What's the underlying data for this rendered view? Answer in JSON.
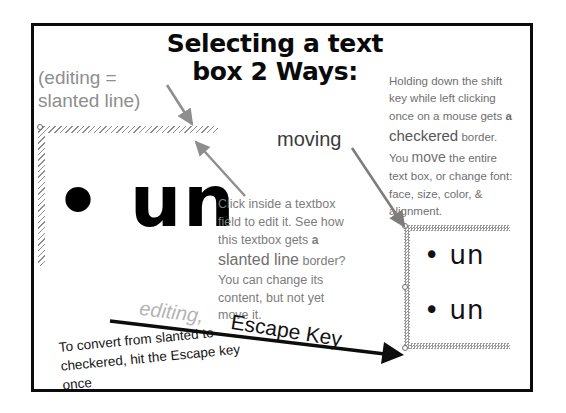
{
  "slide": {
    "title": {
      "line1": "Selecting a text",
      "line2": "box 2 Ways:"
    },
    "labels": {
      "editing_equals": {
        "line1": "(editing =",
        "line2": "slanted line)"
      },
      "moving": "moving",
      "editing_comma": "editing,",
      "escape_key": "Escape Key"
    },
    "center_paragraph": {
      "part1": "Click inside a textbox field to edit it. See how this textbox gets",
      "emphasis_small": "a",
      "emphasis_big": "slanted line",
      "part2": "border? You can change its content, but not yet move it."
    },
    "right_paragraph": {
      "part1": "Holding down the shift key while left clicking once on a mouse gets",
      "emphasis_small": "a",
      "emphasis_big": "checkered",
      "part2_a": "border. You",
      "part2_emph": "move",
      "part2_b": "the entire text box, or change font: face, size, color, & alignment."
    },
    "bottom_note": "To convert from slanted to checkered, hit the Escape key once",
    "slanted_box": {
      "content": "• un",
      "border_style": "slanted-line",
      "handle_count": 1
    },
    "checkered_box": {
      "line1": "• un",
      "line2": "• un",
      "border_style": "checkered",
      "handle_count": 3
    },
    "colors": {
      "frame": "#0b0b0b",
      "title_text": "#0a0a0a",
      "gray_text": "#7c7c7c",
      "light_gray_text": "#b4b4b4",
      "arrow_gray": "#8e8e8e",
      "arrow_black": "#0d0d0d",
      "hatch_gray": "#8d8d8d",
      "checker_gray": "#9a9a9a"
    },
    "icons": {
      "handle": "resize-handle-icon",
      "arrow_gray_down": "arrow-down-right-icon",
      "arrow_gray_up": "arrow-up-left-icon",
      "arrow_gray_moving": "arrow-down-right-icon",
      "arrow_black_escape": "arrow-right-thick-icon"
    }
  }
}
